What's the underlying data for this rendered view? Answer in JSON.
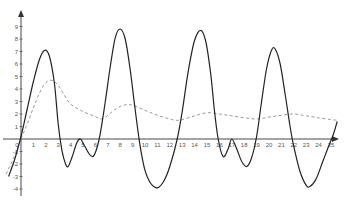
{
  "chart_data": {
    "type": "line",
    "title": "",
    "xlabel": "",
    "ylabel": "",
    "xlim": [
      -1.5,
      25.8
    ],
    "ylim": [
      -4.3,
      9.8
    ],
    "grid": false,
    "legend": null,
    "x_ticks": [
      "0",
      "1",
      "2",
      "3",
      "4",
      "5",
      "6",
      "7",
      "8",
      "9",
      "10",
      "11",
      "12",
      "13",
      "14",
      "15",
      "16",
      "17",
      "18",
      "19",
      "20",
      "21",
      "22",
      "23",
      "24",
      "25"
    ],
    "y_ticks": [
      "-4",
      "-3",
      "-2",
      "-1",
      "0",
      "1",
      "2",
      "3",
      "4",
      "5",
      "6",
      "7",
      "8",
      "9"
    ],
    "series": [
      {
        "name": "solid",
        "style": "solid",
        "color": "#222222",
        "points": [
          [
            -1.0,
            -3.0
          ],
          [
            -0.5,
            -1.6
          ],
          [
            0,
            0.2
          ],
          [
            0.5,
            2.4
          ],
          [
            1.0,
            4.6
          ],
          [
            1.5,
            6.4
          ],
          [
            1.9,
            7.1
          ],
          [
            2.3,
            6.6
          ],
          [
            2.7,
            4.4
          ],
          [
            3.0,
            1.2
          ],
          [
            3.3,
            -0.9
          ],
          [
            3.6,
            -2.0
          ],
          [
            3.8,
            -2.2
          ],
          [
            4.1,
            -1.5
          ],
          [
            4.5,
            -0.3
          ],
          [
            4.8,
            0.0
          ],
          [
            5.1,
            -0.5
          ],
          [
            5.5,
            -1.2
          ],
          [
            5.8,
            -1.4
          ],
          [
            6.1,
            -0.8
          ],
          [
            6.4,
            0.5
          ],
          [
            6.8,
            3.0
          ],
          [
            7.2,
            5.8
          ],
          [
            7.6,
            8.1
          ],
          [
            8.0,
            8.8
          ],
          [
            8.4,
            8.0
          ],
          [
            8.8,
            5.6
          ],
          [
            9.2,
            2.4
          ],
          [
            9.6,
            -0.5
          ],
          [
            10.0,
            -2.5
          ],
          [
            10.5,
            -3.6
          ],
          [
            11.0,
            -3.9
          ],
          [
            11.5,
            -3.4
          ],
          [
            12.0,
            -2.2
          ],
          [
            12.6,
            0.0
          ],
          [
            13.0,
            2.2
          ],
          [
            13.5,
            5.5
          ],
          [
            14.0,
            7.9
          ],
          [
            14.5,
            8.7
          ],
          [
            14.9,
            7.8
          ],
          [
            15.3,
            5.2
          ],
          [
            15.6,
            2.3
          ],
          [
            15.9,
            0.0
          ],
          [
            16.3,
            -1.4
          ],
          [
            16.7,
            -0.8
          ],
          [
            17.0,
            0.0
          ],
          [
            17.4,
            -0.8
          ],
          [
            17.8,
            -1.8
          ],
          [
            18.2,
            -2.2
          ],
          [
            18.6,
            -1.5
          ],
          [
            19.0,
            0.2
          ],
          [
            19.4,
            3.0
          ],
          [
            19.8,
            5.6
          ],
          [
            20.2,
            7.1
          ],
          [
            20.5,
            7.2
          ],
          [
            20.9,
            6.0
          ],
          [
            21.3,
            3.6
          ],
          [
            21.7,
            1.0
          ],
          [
            22.0,
            -0.6
          ],
          [
            22.5,
            -2.6
          ],
          [
            23.0,
            -3.7
          ],
          [
            23.3,
            -3.8
          ],
          [
            23.8,
            -3.2
          ],
          [
            24.3,
            -1.9
          ],
          [
            24.8,
            -0.6
          ],
          [
            25.2,
            0.4
          ],
          [
            25.5,
            1.4
          ]
        ]
      },
      {
        "name": "dashed",
        "style": "dashed",
        "color": "#999999",
        "points": [
          [
            -1.2,
            -2.8
          ],
          [
            -0.6,
            -1.5
          ],
          [
            0,
            0.0
          ],
          [
            0.5,
            1.2
          ],
          [
            1.0,
            2.5
          ],
          [
            1.5,
            3.7
          ],
          [
            2.0,
            4.5
          ],
          [
            2.5,
            4.7
          ],
          [
            3.0,
            4.3
          ],
          [
            3.5,
            3.5
          ],
          [
            4.0,
            2.8
          ],
          [
            5.0,
            2.2
          ],
          [
            6.0,
            1.8
          ],
          [
            6.5,
            1.6
          ],
          [
            7.0,
            1.9
          ],
          [
            7.5,
            2.3
          ],
          [
            8.0,
            2.6
          ],
          [
            8.5,
            2.75
          ],
          [
            9.0,
            2.7
          ],
          [
            10.0,
            2.3
          ],
          [
            11.0,
            1.9
          ],
          [
            12.0,
            1.6
          ],
          [
            12.5,
            1.5
          ],
          [
            13.0,
            1.55
          ],
          [
            14.0,
            1.85
          ],
          [
            15.0,
            2.1
          ],
          [
            16.0,
            2.0
          ],
          [
            17.0,
            1.85
          ],
          [
            18.0,
            1.7
          ],
          [
            19.0,
            1.6
          ],
          [
            20.0,
            1.75
          ],
          [
            21.0,
            1.9
          ],
          [
            22.0,
            2.0
          ],
          [
            23.0,
            1.85
          ],
          [
            24.0,
            1.7
          ],
          [
            25.0,
            1.55
          ],
          [
            25.5,
            1.5
          ]
        ]
      }
    ]
  }
}
